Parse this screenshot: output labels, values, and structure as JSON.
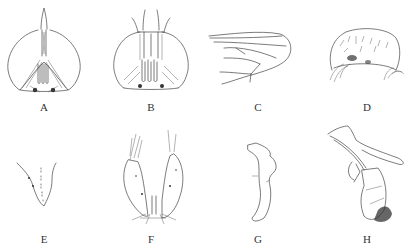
{
  "figure": {
    "type": "morphological line drawings",
    "panels": [
      {
        "label": "A",
        "subject": "head, frontal view"
      },
      {
        "label": "B",
        "subject": "head, frontal view"
      },
      {
        "label": "C",
        "subject": "wing"
      },
      {
        "label": "D",
        "subject": "setose plate"
      },
      {
        "label": "E",
        "subject": "structure with dotted line"
      },
      {
        "label": "F",
        "subject": "paired setose lobes"
      },
      {
        "label": "G",
        "subject": "sclerite"
      },
      {
        "label": "H",
        "subject": "genital complex, lateral"
      }
    ]
  }
}
